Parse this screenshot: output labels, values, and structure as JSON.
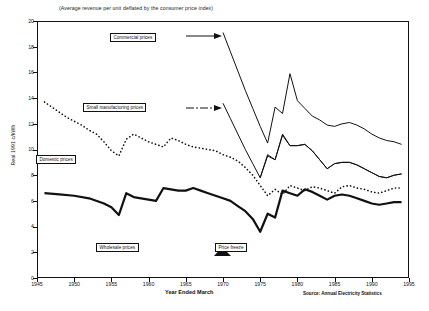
{
  "chart_data": {
    "type": "line",
    "title": "",
    "subtitle": "(Average revenue per unit  deflated by the consumer price index)",
    "xlabel": "Year Ended March",
    "ylabel": "Real 1991 c/kWh",
    "source": "Source: Annual Electricity Statistics",
    "xlim": [
      1945,
      1995
    ],
    "ylim": [
      0,
      20
    ],
    "xticks": [
      1945,
      1950,
      1955,
      1960,
      1965,
      1970,
      1975,
      1980,
      1985,
      1990,
      1995
    ],
    "yticks": [
      0,
      2,
      4,
      6,
      8,
      10,
      12,
      14,
      16,
      18,
      20
    ],
    "grid": false,
    "legend_position": "inline-annotations",
    "series": [
      {
        "name": "Commercial prices",
        "style": "solid-thin",
        "x": [
          1970,
          1971,
          1972,
          1973,
          1974,
          1975,
          1976,
          1977,
          1978,
          1979,
          1980,
          1981,
          1982,
          1983,
          1984,
          1985,
          1986,
          1987,
          1988,
          1989,
          1990,
          1991,
          1992,
          1993,
          1994
        ],
        "y": [
          19.1,
          17.6,
          16.1,
          14.6,
          13.2,
          11.8,
          10.5,
          13.3,
          12.8,
          15.9,
          13.8,
          13.2,
          12.6,
          12.3,
          11.9,
          11.8,
          12.0,
          12.1,
          11.9,
          11.6,
          11.2,
          10.9,
          10.7,
          10.6,
          10.4
        ]
      },
      {
        "name": "Small manufacturing prices",
        "style": "solid-thin",
        "x": [
          1970,
          1971,
          1972,
          1973,
          1974,
          1975,
          1976,
          1977,
          1978,
          1979,
          1980,
          1981,
          1982,
          1983,
          1984,
          1985,
          1986,
          1987,
          1988,
          1989,
          1990,
          1991,
          1992,
          1993,
          1994
        ],
        "y": [
          13.6,
          12.4,
          11.2,
          10.0,
          8.9,
          7.8,
          9.6,
          9.2,
          11.2,
          10.3,
          10.3,
          10.4,
          9.9,
          9.2,
          8.5,
          8.9,
          9.0,
          9.0,
          8.8,
          8.5,
          8.2,
          7.9,
          7.8,
          8.0,
          8.1
        ]
      },
      {
        "name": "Wholesale prices",
        "style": "solid-thin-lower",
        "x": [
          1975,
          1976,
          1977,
          1978,
          1979,
          1980,
          1981,
          1982,
          1983,
          1984,
          1985,
          1986,
          1987,
          1988,
          1989,
          1990,
          1991,
          1992,
          1993,
          1994
        ],
        "y": [
          7.8,
          9.5,
          9.2,
          11.1,
          10.3,
          10.3,
          10.4,
          9.9,
          9.2,
          8.5,
          8.9,
          9.0,
          9.0,
          8.8,
          8.5,
          8.2,
          7.9,
          7.8,
          8.0,
          8.1
        ]
      },
      {
        "name": "Small manufacturing prices (historic)",
        "style": "dotted",
        "x": [
          1946,
          1947,
          1948,
          1949,
          1950,
          1951,
          1952,
          1953,
          1954,
          1955,
          1956,
          1957,
          1958,
          1959,
          1960,
          1961,
          1962,
          1963,
          1964,
          1965,
          1966,
          1967,
          1968,
          1969,
          1970,
          1971,
          1972,
          1973,
          1974,
          1975,
          1976,
          1977,
          1978,
          1979,
          1980,
          1981,
          1982,
          1983,
          1984,
          1985,
          1986,
          1987,
          1988,
          1989,
          1990,
          1991,
          1992,
          1993,
          1994
        ],
        "y": [
          13.7,
          13.3,
          12.9,
          12.5,
          12.2,
          11.9,
          11.5,
          11.2,
          10.6,
          9.9,
          9.5,
          10.8,
          11.2,
          10.9,
          10.6,
          10.4,
          10.2,
          10.9,
          10.7,
          10.4,
          10.2,
          10.1,
          10.0,
          9.9,
          9.6,
          9.4,
          9.1,
          8.6,
          8.0,
          7.2,
          6.4,
          6.9,
          6.5,
          7.2,
          7.0,
          6.8,
          7.1,
          7.0,
          6.8,
          6.6,
          7.1,
          7.2,
          7.0,
          6.9,
          6.7,
          6.6,
          6.8,
          7.0,
          7.0
        ]
      },
      {
        "name": "Domestic prices",
        "style": "solid-thick",
        "x": [
          1946,
          1948,
          1950,
          1952,
          1954,
          1955,
          1956,
          1957,
          1958,
          1959,
          1960,
          1961,
          1962,
          1963,
          1964,
          1965,
          1966,
          1967,
          1968,
          1969,
          1970,
          1971,
          1972,
          1973,
          1974,
          1975,
          1976,
          1977,
          1978,
          1979,
          1980,
          1981,
          1982,
          1983,
          1984,
          1985,
          1986,
          1987,
          1988,
          1989,
          1990,
          1991,
          1992,
          1993,
          1994
        ],
        "y": [
          6.6,
          6.5,
          6.4,
          6.2,
          5.8,
          5.5,
          4.9,
          6.6,
          6.3,
          6.2,
          6.1,
          6.0,
          7.0,
          6.9,
          6.8,
          6.8,
          7.0,
          6.8,
          6.6,
          6.4,
          6.2,
          6.0,
          5.6,
          5.2,
          4.6,
          3.6,
          5.0,
          4.7,
          6.8,
          6.6,
          6.4,
          6.9,
          6.7,
          6.4,
          6.1,
          6.4,
          6.5,
          6.4,
          6.2,
          6.0,
          5.8,
          5.7,
          5.8,
          5.9,
          5.9
        ]
      }
    ],
    "annotations": [
      {
        "name": "commercial-prices-label",
        "text": "Commercial prices",
        "x_px": 110,
        "y_px": 33
      },
      {
        "name": "small-manufacturing-prices-label",
        "text": "Small manufacturing prices",
        "x_px": 83,
        "y_px": 103
      },
      {
        "name": "domestic-prices-label",
        "text": "Domestic prices",
        "x_px": 36,
        "y_px": 155
      },
      {
        "name": "wholesale-prices-label",
        "text": "Wholesale prices",
        "x_px": 96,
        "y_px": 243
      },
      {
        "name": "price-freeze-label",
        "text": "Price freeze",
        "x_px": 215,
        "y_px": 243
      }
    ]
  }
}
